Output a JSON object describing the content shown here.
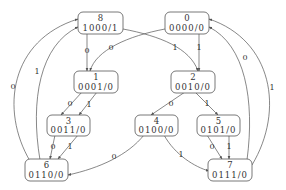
{
  "diagram": {
    "type": "state-machine",
    "nodes": [
      {
        "id": "8",
        "state": "8",
        "code": "1000/1"
      },
      {
        "id": "0",
        "state": "0",
        "code": "0000/0"
      },
      {
        "id": "1",
        "state": "1",
        "code": "0001/0"
      },
      {
        "id": "2",
        "state": "2",
        "code": "0010/0"
      },
      {
        "id": "3",
        "state": "3",
        "code": "0011/0"
      },
      {
        "id": "4",
        "state": "4",
        "code": "0100/0"
      },
      {
        "id": "5",
        "state": "5",
        "code": "0101/0"
      },
      {
        "id": "6",
        "state": "6",
        "code": "0110/0"
      },
      {
        "id": "7",
        "state": "7",
        "code": "0111/0"
      }
    ],
    "edges": [
      {
        "from": "8",
        "to": "1",
        "label": "0"
      },
      {
        "from": "8",
        "to": "2",
        "label": "1"
      },
      {
        "from": "0",
        "to": "1",
        "label": "0"
      },
      {
        "from": "0",
        "to": "2",
        "label": "1"
      },
      {
        "from": "1",
        "to": "3",
        "label": "0"
      },
      {
        "from": "1",
        "to": "3",
        "label": "1"
      },
      {
        "from": "2",
        "to": "4",
        "label": "0"
      },
      {
        "from": "2",
        "to": "5",
        "label": "1"
      },
      {
        "from": "3",
        "to": "6",
        "label": "0"
      },
      {
        "from": "3",
        "to": "6",
        "label": "1"
      },
      {
        "from": "4",
        "to": "6",
        "label": "0"
      },
      {
        "from": "4",
        "to": "7",
        "label": "1"
      },
      {
        "from": "5",
        "to": "7",
        "label": "0"
      },
      {
        "from": "5",
        "to": "7",
        "label": "1"
      },
      {
        "from": "6",
        "to": "8",
        "label": "0"
      },
      {
        "from": "6",
        "to": "8",
        "label": "1"
      },
      {
        "from": "7",
        "to": "0",
        "label": "0"
      },
      {
        "from": "7",
        "to": "0",
        "label": "1"
      }
    ]
  }
}
